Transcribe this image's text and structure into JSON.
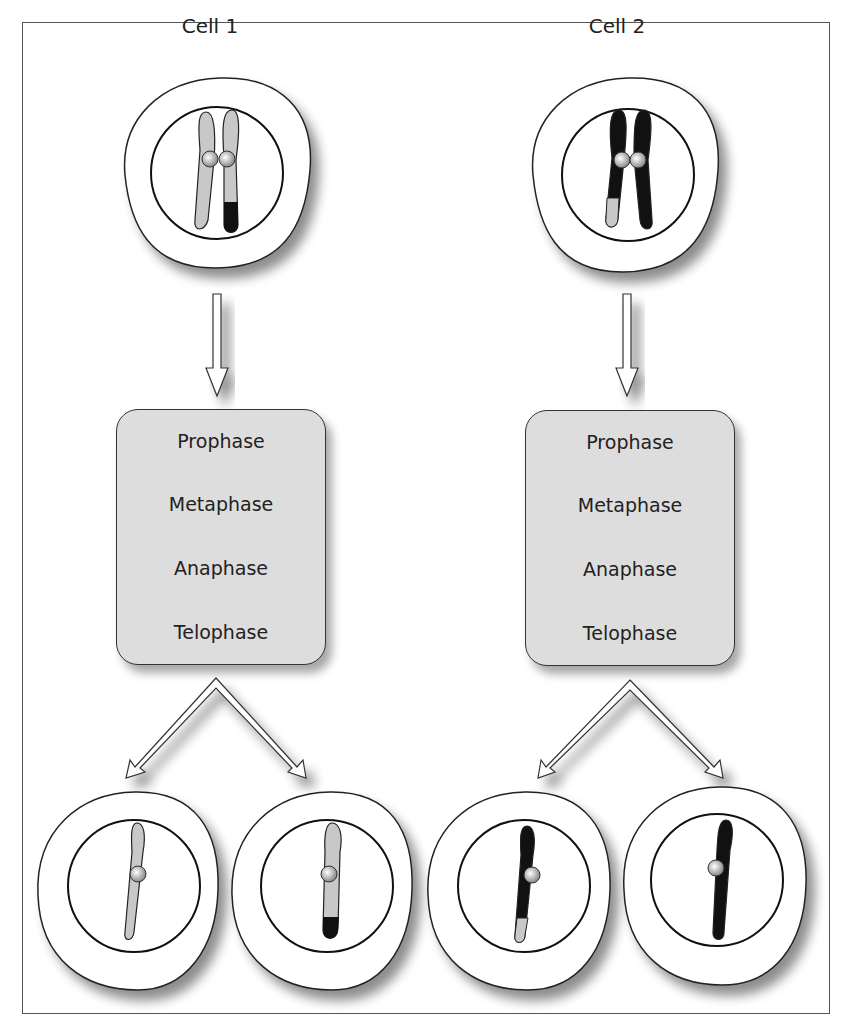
{
  "cells": [
    {
      "title": "Cell 1",
      "phases": [
        "Prophase",
        "Metaphase",
        "Anaphase",
        "Telophase"
      ]
    },
    {
      "title": "Cell 2",
      "phases": [
        "Prophase",
        "Metaphase",
        "Anaphase",
        "Telophase"
      ]
    }
  ],
  "colors": {
    "light_chromatin": "#c8c8c8",
    "dark_chromatin": "#111111",
    "box_fill": "#dddddd"
  }
}
